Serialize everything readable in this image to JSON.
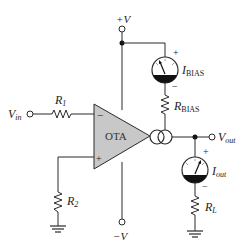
{
  "diagram": {
    "colors": {
      "wire": "#2a2a2a",
      "ota_fill": "#c8c8c8",
      "background": "#ffffff"
    },
    "ota": {
      "label": "OTA",
      "inverting": "−",
      "noninverting": "+"
    },
    "supply": {
      "positive": "+V",
      "negative": "−V"
    },
    "input": {
      "label": "V",
      "sub": "in"
    },
    "output": {
      "label": "V",
      "sub": "out"
    },
    "resistors": {
      "r1": {
        "label": "R",
        "sub": "1"
      },
      "r2": {
        "label": "R",
        "sub": "2"
      },
      "rbias": {
        "label": "R",
        "sub": "BIAS"
      },
      "rl": {
        "label": "R",
        "sub": "L"
      }
    },
    "meters": {
      "ibias": {
        "label": "I",
        "sub": "BIAS",
        "plus": "+",
        "minus": "−"
      },
      "iout": {
        "label": "I",
        "sub": "out",
        "plus": "+",
        "minus": "−"
      }
    }
  }
}
